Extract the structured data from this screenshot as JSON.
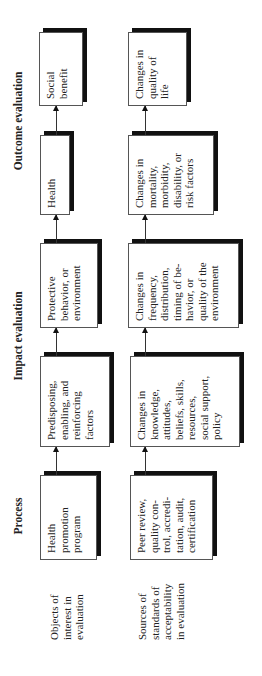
{
  "headers": {
    "process": "Process",
    "impact": "Impact evaluation",
    "outcome": "Outcome evaluation"
  },
  "row_labels": {
    "objects": "Objects of\ninterest in\nevaluation",
    "sources": "Sources of\nstandards of\nacceptability\nin evaluation"
  },
  "objects_row": [
    {
      "label": "Health\npromotion\nprogram"
    },
    {
      "label": "Predisposing,\nenabling, and\nreinforcing\nfactors"
    },
    {
      "label": "Protective\nbehavior, or\nenvironment"
    },
    {
      "label": "Health"
    },
    {
      "label": "Social\nbenefit"
    }
  ],
  "sources_row": [
    {
      "label": "Peer review,\nquality con-\ntrol, accredi-\ntation, audit,\ncertification"
    },
    {
      "label": "Changes in\nknowledge,\nattitudes,\nbeliefs, skills,\nresources,\nsocial support,\npolicy"
    },
    {
      "label": "Changes in\nfrequency,\ndistribution,\ntiming of be-\nhavior, or\nquality of the\nenvironment"
    },
    {
      "label": "Changes in\nmortality,\nmorbidity,\ndisability, or\nrisk factors"
    },
    {
      "label": "Changes in\nquality of\nlife"
    }
  ]
}
